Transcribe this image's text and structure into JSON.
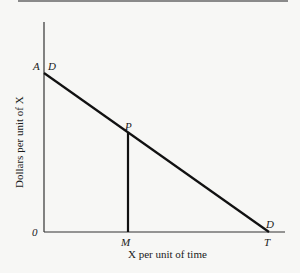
{
  "diagram": {
    "y_axis_label": "Dollars per unit of X",
    "x_axis_label": "X per unit of time",
    "origin_label": "0",
    "intercept_y_label": "A",
    "intercept_x_label": "T",
    "point_label": "P",
    "point_x_label": "M",
    "demand_label_top": "D",
    "demand_label_bottom": "D"
  }
}
